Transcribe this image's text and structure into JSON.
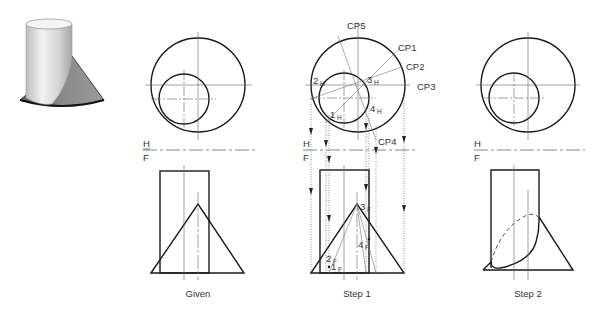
{
  "figure": {
    "pictorial": {
      "description": "cylinder intersecting cone, shaded 3D view"
    },
    "panels": [
      {
        "id": "given",
        "caption": "Given",
        "plane_labels": {
          "top": "H",
          "bottom": "F"
        }
      },
      {
        "id": "step1",
        "caption": "Step 1",
        "plane_labels": {
          "top": "H",
          "bottom": "F"
        },
        "cutting_planes": [
          "CP1",
          "CP2",
          "CP3",
          "CP4",
          "CP5"
        ],
        "points_top": [
          {
            "num": "1",
            "sub": "H"
          },
          {
            "num": "2",
            "sub": "H"
          },
          {
            "num": "3",
            "sub": "H"
          },
          {
            "num": "4",
            "sub": "H"
          }
        ],
        "points_front": [
          {
            "num": "1",
            "sub": "F"
          },
          {
            "num": "2",
            "sub": "F"
          },
          {
            "num": "3",
            "sub": "F"
          },
          {
            "num": "4",
            "sub": "F"
          }
        ]
      },
      {
        "id": "step2",
        "caption": "Step 2",
        "plane_labels": {
          "top": "H",
          "bottom": "F"
        }
      }
    ]
  },
  "colors": {
    "line": "#1a1a1a",
    "construction": "#666666",
    "background": "#ffffff"
  }
}
